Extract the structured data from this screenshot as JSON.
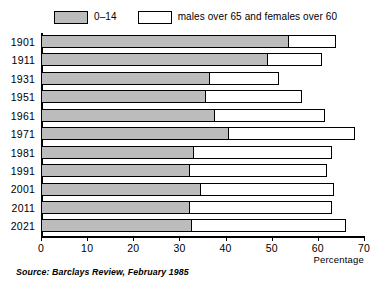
{
  "legend": {
    "items": [
      {
        "label": "0–14",
        "swatch": "grey"
      },
      {
        "label": "males over 65 and females over 60",
        "swatch": "white"
      }
    ]
  },
  "axis": {
    "x_title": "Percentage",
    "x_ticks": [
      "0",
      "10",
      "20",
      "30",
      "40",
      "50",
      "60",
      "70"
    ]
  },
  "source": "Source: Barclays Review, February 1985",
  "colors": {
    "young_fill": "#bcbcbc",
    "old_fill": "#ffffff",
    "outline": "#000000"
  },
  "chart_data": {
    "type": "bar",
    "orientation": "horizontal",
    "stacked": true,
    "title": "",
    "xlabel": "Percentage",
    "ylabel": "",
    "xlim": [
      0,
      70
    ],
    "xticks": [
      0,
      10,
      20,
      30,
      40,
      50,
      60,
      70
    ],
    "grid": false,
    "legend_position": "top",
    "categories": [
      "1901",
      "1911",
      "1931",
      "1951",
      "1961",
      "1971",
      "1981",
      "1991",
      "2001",
      "2011",
      "2021"
    ],
    "series": [
      {
        "name": "0–14",
        "values": [
          53.5,
          49,
          36.5,
          35.5,
          37.5,
          40.5,
          33,
          32,
          34.5,
          32,
          32.5
        ]
      },
      {
        "name": "males over 65 and females over 60",
        "values": [
          10.5,
          12,
          15,
          21,
          24,
          27.5,
          30,
          30,
          29,
          31,
          33.5
        ]
      }
    ],
    "totals": [
      64,
      61,
      51.5,
      56.5,
      61.5,
      68,
      63,
      62,
      63.5,
      63,
      66
    ]
  }
}
